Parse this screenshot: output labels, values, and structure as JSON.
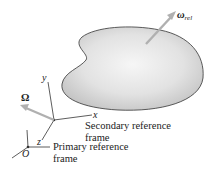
{
  "figure": {
    "body_shape": "rigid-body-blob",
    "labels": {
      "omega_rel": {
        "symbol": "ω",
        "subscript": "rel"
      },
      "Omega": "Ω",
      "secondary_frame": {
        "axes": {
          "x": "x",
          "y": "y",
          "z": "z"
        },
        "line1": "Secondary reference",
        "line2": "frame"
      },
      "primary_frame": {
        "origin": "O",
        "line1": "Primary reference",
        "line2": "frame"
      }
    },
    "colors": {
      "arrow": "#b5b5b5",
      "blob_fill_center": "#f4f4f4",
      "blob_fill_edge": "#c8c8c8",
      "outline": "#333333",
      "text": "#222222"
    }
  }
}
